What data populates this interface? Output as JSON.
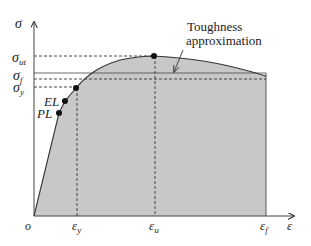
{
  "diagram": {
    "colors": {
      "fill": "#c8c8c8",
      "line": "#333333",
      "text": "#222222"
    },
    "axes": {
      "y_label": "σ",
      "x_label": "ε",
      "origin_label": "o"
    },
    "y_ticks": [
      {
        "label": "σ",
        "sub": "ut",
        "y": 56
      },
      {
        "label": "σ",
        "sub": "f",
        "y": 79
      },
      {
        "label": "σ",
        "sub": "y",
        "y": 87
      }
    ],
    "x_ticks": [
      {
        "label": "ε",
        "sub": "y",
        "x": 77
      },
      {
        "label": "ε",
        "sub": "u",
        "x": 155
      },
      {
        "label": "ε",
        "sub": "f",
        "x": 266
      }
    ],
    "points": [
      {
        "label": "PL",
        "x": 59,
        "y": 113
      },
      {
        "label": "EL",
        "x": 65,
        "y": 101
      },
      {
        "label": "yield",
        "x": 76,
        "y": 88
      },
      {
        "label": "ultimate",
        "x": 154,
        "y": 56
      }
    ],
    "annotation": {
      "line1": "Toughness",
      "line2": "approximation"
    }
  }
}
